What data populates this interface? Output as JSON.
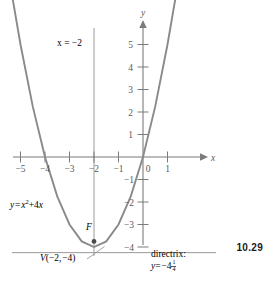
{
  "figure": {
    "number": "10.29",
    "caption_equation": "y = x² + 4x"
  },
  "chart_data": {
    "type": "line",
    "title": "",
    "subtitle": "",
    "xlabel": "x",
    "ylabel": "y",
    "xlim": [
      -5.7,
      1.6
    ],
    "ylim": [
      -4.6,
      5.9
    ],
    "grid": false,
    "legend_position": "none",
    "function": "y = x^2 + 4x",
    "series": [
      {
        "name": "y = x^2 + 4x",
        "color": "#8a8a8a",
        "x": [
          -5.35,
          -5.0,
          -4.5,
          -4.0,
          -3.5,
          -3.0,
          -2.5,
          -2.0,
          -1.5,
          -1.0,
          -0.5,
          0.0,
          0.5,
          1.0,
          1.35
        ],
        "values": [
          7.22,
          5.0,
          2.25,
          0.0,
          -1.75,
          -3.0,
          -3.75,
          -4.0,
          -3.75,
          -3.0,
          -1.75,
          0.0,
          2.25,
          5.0,
          7.22
        ]
      }
    ],
    "x_ticks": [
      -5,
      -4,
      -3,
      -2,
      -1,
      0,
      1
    ],
    "x_tick_labels": [
      "-5",
      "-4",
      "-3",
      "-2",
      "-1",
      "0",
      "1"
    ],
    "y_ticks": [
      -4,
      -3,
      -2,
      -1,
      1,
      2,
      3,
      4,
      5
    ],
    "y_tick_labels": [
      "-4",
      "-3",
      "-2",
      "-1",
      "1",
      "2",
      "3",
      "4",
      "5"
    ],
    "annotations": {
      "axis_of_symmetry": {
        "label": "x = −2",
        "value": -2,
        "type": "vertical-line"
      },
      "curve_equation": {
        "label": "y = x² + 4x",
        "label_base": "y = x",
        "label_exp": "2",
        "label_tail": "+ 4x"
      },
      "vertex": {
        "point_label": "V(−2, −4)",
        "x": -2,
        "y": -4
      },
      "focus": {
        "point_label": "F",
        "x": -2,
        "y": -3.75
      },
      "directrix": {
        "label_line1": "directrix:",
        "label_line2_base": "y = −4",
        "label_line2_num": "1",
        "label_line2_den": "4",
        "value": -4.25,
        "type": "horizontal-line"
      }
    },
    "colors": {
      "curve": "#8a8a8a",
      "axis": "#7b7b7b",
      "aux_line": "#9a9a9a",
      "text": "#5a5a5a",
      "point": "#4a4a4a",
      "background": "#ffffff"
    }
  }
}
